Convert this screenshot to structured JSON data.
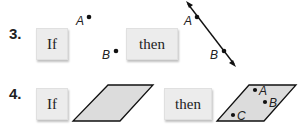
{
  "problems": [
    {
      "number": "3.",
      "if_label": "If",
      "then_label": "then",
      "if_figure": {
        "type": "two points",
        "points": [
          "A",
          "B"
        ]
      },
      "then_figure": {
        "type": "line through points",
        "points": [
          "A",
          "B"
        ]
      }
    },
    {
      "number": "4.",
      "if_label": "If",
      "then_label": "then",
      "if_figure": {
        "type": "plane (parallelogram)",
        "points": []
      },
      "then_figure": {
        "type": "plane with points",
        "points": [
          "A",
          "B",
          "C"
        ]
      }
    }
  ]
}
